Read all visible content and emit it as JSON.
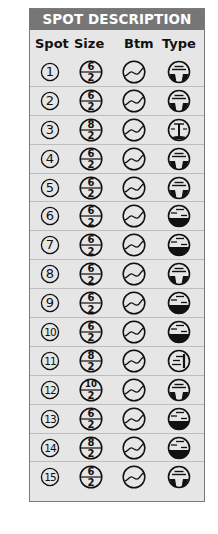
{
  "panel": {
    "title": "SPOT DESCRIPTION",
    "colors": {
      "title_bar": "#767676",
      "panel_bg": "#e6e6e6",
      "ink": "#111111"
    },
    "columns": [
      "Spot",
      "Size",
      "Btm",
      "Type"
    ]
  },
  "rows": [
    {
      "spot": "1",
      "size_top": "6",
      "size_bottom": "2",
      "bottom_icon": "wavy-bottom-icon",
      "type_icon": "dropoff-lines-icon"
    },
    {
      "spot": "2",
      "size_top": "6",
      "size_bottom": "2",
      "bottom_icon": "wavy-bottom-icon",
      "type_icon": "dropoff-lines-icon"
    },
    {
      "spot": "3",
      "size_top": "8",
      "size_bottom": "2",
      "bottom_icon": "wavy-bottom-icon",
      "type_icon": "post-structure-icon"
    },
    {
      "spot": "4",
      "size_top": "6",
      "size_bottom": "2",
      "bottom_icon": "wavy-bottom-icon",
      "type_icon": "dropoff-lines-icon"
    },
    {
      "spot": "5",
      "size_top": "6",
      "size_bottom": "2",
      "bottom_icon": "wavy-bottom-icon",
      "type_icon": "dropoff-lines-icon"
    },
    {
      "spot": "6",
      "size_top": "6",
      "size_bottom": "2",
      "bottom_icon": "wavy-bottom-icon",
      "type_icon": "flat-bottom-dashes-icon"
    },
    {
      "spot": "7",
      "size_top": "6",
      "size_bottom": "2",
      "bottom_icon": "wavy-bottom-icon",
      "type_icon": "flat-bottom-dashes-icon"
    },
    {
      "spot": "8",
      "size_top": "6",
      "size_bottom": "2",
      "bottom_icon": "wavy-bottom-icon",
      "type_icon": "dropoff-lines-icon"
    },
    {
      "spot": "9",
      "size_top": "6",
      "size_bottom": "2",
      "bottom_icon": "wavy-bottom-icon",
      "type_icon": "flat-bottom-dashes-icon"
    },
    {
      "spot": "10",
      "size_top": "6",
      "size_bottom": "2",
      "bottom_icon": "wavy-bottom-icon",
      "type_icon": "flat-bottom-dashes-icon"
    },
    {
      "spot": "11",
      "size_top": "8",
      "size_bottom": "2",
      "bottom_icon": "wavy-bottom-icon",
      "type_icon": "wall-icon"
    },
    {
      "spot": "12",
      "size_top": "10",
      "size_bottom": "2",
      "bottom_icon": "wavy-bottom-icon",
      "type_icon": "dropoff-lines-icon"
    },
    {
      "spot": "13",
      "size_top": "6",
      "size_bottom": "2",
      "bottom_icon": "wavy-bottom-icon",
      "type_icon": "flat-bottom-dashes-icon"
    },
    {
      "spot": "14",
      "size_top": "8",
      "size_bottom": "2",
      "bottom_icon": "wavy-bottom-icon",
      "type_icon": "flat-bottom-dashes-icon"
    },
    {
      "spot": "15",
      "size_top": "6",
      "size_bottom": "2",
      "bottom_icon": "wavy-bottom-icon",
      "type_icon": "dropoff-lines-icon"
    }
  ]
}
